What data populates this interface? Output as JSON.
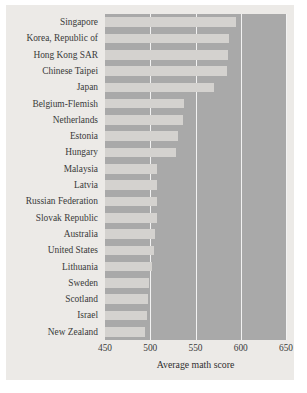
{
  "chart_data": {
    "type": "bar",
    "orientation": "horizontal",
    "title": "",
    "subtitle": "",
    "xlabel": "Average math score",
    "ylabel": "",
    "xlim": [
      450,
      650
    ],
    "xticks": [
      450,
      500,
      550,
      600,
      650
    ],
    "xticklabels": [
      "450",
      "500",
      "550",
      "600",
      "650"
    ],
    "grid": true,
    "grid_axis": "x",
    "legend": false,
    "legend_position": "none",
    "categories": [
      "Singapore",
      "Korea, Republic of",
      "Hong Kong SAR",
      "Chinese Taipei",
      "Japan",
      "Belgium-Flemish",
      "Netherlands",
      "Estonia",
      "Hungary",
      "Malaysia",
      "Latvia",
      "Russian Federation",
      "Slovak Republic",
      "Australia",
      "United States",
      "Lithuania",
      "Sweden",
      "Scotland",
      "Israel",
      "New Zealand"
    ],
    "values": [
      595,
      587,
      586,
      585,
      570,
      537,
      536,
      531,
      529,
      508,
      508,
      508,
      508,
      505,
      504,
      502,
      499,
      498,
      496,
      494
    ],
    "series": [
      {
        "name": "Average math score",
        "values": [
          595,
          587,
          586,
          585,
          570,
          537,
          536,
          531,
          529,
          508,
          508,
          508,
          508,
          505,
          504,
          502,
          499,
          498,
          496,
          494
        ]
      }
    ]
  },
  "colors": {
    "figure_background": "#ffffff",
    "panel_background": "#eceae7",
    "plot_background": "#a9a9a9",
    "bar": "#d4d2cf",
    "gridline": "#f2f2f2",
    "text": "#3a3a3a"
  }
}
